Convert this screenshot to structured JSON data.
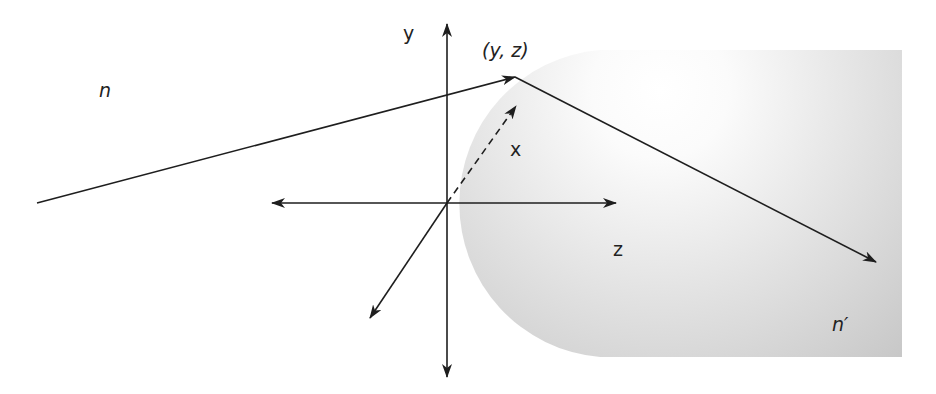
{
  "diagram": {
    "type": "refraction-geometry",
    "labels": {
      "medium_left": "n",
      "medium_right": "n′",
      "axis_y": "y",
      "axis_x": "x",
      "axis_z": "z",
      "point": "(y, z)"
    },
    "colors": {
      "line": "#1e1e1e",
      "text": "#222222",
      "medium_light": "#fdfdfd",
      "medium_mid": "#e4e4e4",
      "medium_dark": "#c4c4c4",
      "background": "#ffffff"
    },
    "elements": {
      "incident_ray": {
        "from": [
          37,
          203
        ],
        "to": [
          515,
          77
        ]
      },
      "refracted_ray": {
        "from": [
          515,
          77
        ],
        "to": [
          876,
          262
        ]
      },
      "origin": [
        447,
        203
      ],
      "y_axis": {
        "top": [
          447,
          24
        ],
        "bottom": [
          447,
          377
        ]
      },
      "z_axis": {
        "left": [
          272,
          203
        ],
        "right": [
          616,
          203
        ]
      },
      "x_axis_dashed": {
        "from": [
          447,
          203
        ],
        "to": [
          516,
          106
        ]
      },
      "x_axis_back": {
        "from": [
          447,
          203
        ],
        "to": [
          370,
          318
        ]
      },
      "medium_shape": {
        "arc_center": [
          600,
          203
        ],
        "radius": 153,
        "right": 902,
        "top": 50,
        "bottom": 357
      }
    }
  }
}
